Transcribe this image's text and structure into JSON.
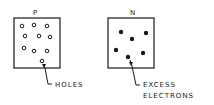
{
  "diagram": {
    "p_region": {
      "title": "P",
      "carrier": "holes",
      "label": "HOLES",
      "hole_count": 10
    },
    "n_region": {
      "title": "N",
      "carrier": "electrons",
      "label_line1": "EXCESS",
      "label_line2": "ELECTRONS",
      "electron_count": 6
    },
    "colors": {
      "stroke": "#1a1a1a",
      "background": "#ffffff"
    }
  }
}
